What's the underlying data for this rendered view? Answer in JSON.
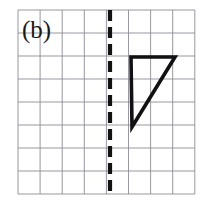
{
  "figure": {
    "panel_label": "(b)",
    "background_color": "#ffffff",
    "grid": {
      "columns": 8,
      "rows": 8,
      "left": 18,
      "top": 10,
      "cell_width": 22.1,
      "cell_height": 23.0,
      "line_color": "#8c8c96",
      "line_width": 0.9
    },
    "mirror_line": {
      "name": "line-of-reflection",
      "orientation": "vertical",
      "x": 110,
      "y_start": 10,
      "y_end": 194,
      "color": "#121212",
      "line_width": 4.2,
      "dash_pattern": "11 6"
    },
    "triangle": {
      "name": "right-triangle-shape",
      "points": [
        [
          131,
          57
        ],
        [
          175,
          57
        ],
        [
          132,
          127
        ]
      ],
      "stroke_color": "#111111",
      "stroke_width": 3.6,
      "fill": "none"
    }
  },
  "chart_data": {
    "type": "scatter",
    "title": "(b)",
    "xlabel": "",
    "ylabel": "",
    "xlim": [
      0,
      8
    ],
    "ylim": [
      0,
      8
    ],
    "grid": true,
    "legend": "none",
    "annotations": [
      {
        "name": "panel-label",
        "text": "(b)",
        "x": 0.2,
        "y": 7.3
      },
      {
        "name": "line-of-reflection",
        "text": "dashed vertical mirror line",
        "x": 4.16,
        "y_range": [
          0,
          8
        ]
      },
      {
        "name": "triangle",
        "text": "right triangle, vertices in grid units",
        "vertices": [
          [
            5.11,
            5.96
          ],
          [
            7.1,
            5.96
          ],
          [
            5.16,
            2.91
          ]
        ]
      }
    ]
  }
}
